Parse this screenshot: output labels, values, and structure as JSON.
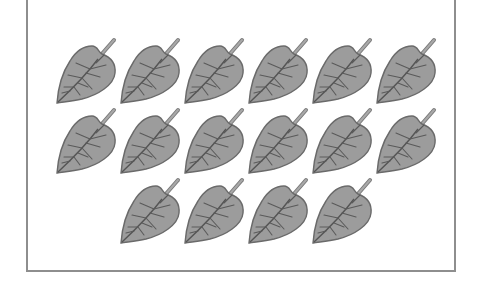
{
  "figure": {
    "rows": [
      {
        "count": 6,
        "start_col": 0
      },
      {
        "count": 6,
        "start_col": 0
      },
      {
        "count": 4,
        "start_col": 1
      }
    ],
    "total_leaves": 16,
    "colors": {
      "frame_border": "#8e8e8e",
      "leaf_fill": "#9a9a9a",
      "leaf_outline": "#6a6a6a",
      "vein": "#5a5a5a",
      "stem": "#8a8a8a"
    }
  }
}
